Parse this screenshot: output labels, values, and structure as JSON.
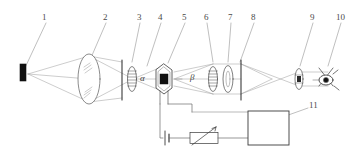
{
  "figure": {
    "background_color": "#ffffff",
    "line_color": "#4a4a4a",
    "fill_dark": "#111111",
    "width": 364,
    "height": 155
  },
  "callouts": [
    {
      "id": "1",
      "label": "1",
      "x": 44,
      "y": 17,
      "tip_x": 22,
      "tip_y": 70
    },
    {
      "id": "2",
      "label": "2",
      "x": 105,
      "y": 17,
      "tip_x": 89,
      "tip_y": 62
    },
    {
      "id": "3",
      "label": "3",
      "x": 139,
      "y": 17,
      "tip_x": 131,
      "tip_y": 62
    },
    {
      "id": "4",
      "label": "4",
      "x": 160,
      "y": 17,
      "tip_x": 146,
      "tip_y": 64
    },
    {
      "id": "5",
      "label": "5",
      "x": 184,
      "y": 17,
      "tip_x": 167,
      "tip_y": 62
    },
    {
      "id": "6",
      "label": "6",
      "x": 206,
      "y": 17,
      "tip_x": 212,
      "tip_y": 62
    },
    {
      "id": "7",
      "label": "7",
      "x": 230,
      "y": 17,
      "tip_x": 227,
      "tip_y": 62
    },
    {
      "id": "8",
      "label": "8",
      "x": 253,
      "y": 17,
      "tip_x": 239,
      "tip_y": 62
    },
    {
      "id": "9",
      "label": "9",
      "x": 312,
      "y": 17,
      "tip_x": 299,
      "tip_y": 64
    },
    {
      "id": "10",
      "label": "10",
      "x": 340,
      "y": 17,
      "tip_x": 327,
      "tip_y": 64
    },
    {
      "id": "11",
      "label": "11",
      "x": 311,
      "y": 106,
      "tip_x": 248,
      "tip_y": 129
    }
  ],
  "angles": [
    {
      "name": "alpha",
      "label": "α",
      "x": 142,
      "y": 78
    },
    {
      "name": "beta",
      "label": "β",
      "x": 192,
      "y": 77
    }
  ],
  "components": {
    "source": {
      "name": "light-source",
      "x": 22,
      "y": 64,
      "w": 6,
      "h": 17
    },
    "condenser": {
      "name": "condenser-lens",
      "cx": 89,
      "cy": 79,
      "rx": 11,
      "ry": 25
    },
    "slit_left": {
      "name": "slit-aperture-left",
      "x": 122,
      "y": 60,
      "h": 40
    },
    "polarizer": {
      "name": "polarizer",
      "cx": 132,
      "cy": 79,
      "rx": 4,
      "ry": 12
    },
    "crystal": {
      "name": "electro-optic-crystal",
      "cx": 164,
      "cy": 79,
      "rx": 10,
      "ry": 15
    },
    "analyzer": {
      "name": "analyzer",
      "cx": 213,
      "cy": 79,
      "rx": 4,
      "ry": 12
    },
    "lens_7": {
      "name": "objective-lens",
      "cx": 228,
      "cy": 79,
      "rx": 5,
      "ry": 13
    },
    "slit_right": {
      "name": "slit-aperture-right",
      "x": 241,
      "y": 60,
      "h": 40
    },
    "lens_9": {
      "name": "eyepiece-lens",
      "cx": 299,
      "cy": 79,
      "rx": 4,
      "ry": 10
    },
    "detector": {
      "name": "eye-detector",
      "cx": 328,
      "cy": 80
    },
    "power_box": {
      "name": "power-supply-unit",
      "x": 248,
      "y": 112,
      "w": 40,
      "h": 33
    },
    "battery": {
      "name": "battery-symbol",
      "x": 165,
      "y": 133
    },
    "rheostat": {
      "name": "variable-resistor",
      "x": 190,
      "y": 127,
      "w": 28,
      "h": 11
    }
  }
}
